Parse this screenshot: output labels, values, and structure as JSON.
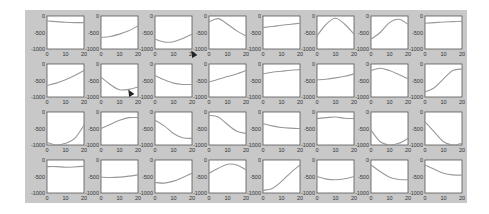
{
  "figure": {
    "background": "#c8c8c8",
    "axes_background": "#ffffff",
    "line_color": "#999999",
    "frame_color": "#555555"
  },
  "chart_data": {
    "type": "line",
    "layout": {
      "rows": 4,
      "cols": 8,
      "grid": false,
      "legend": "none"
    },
    "shared_axes": {
      "xlim": [
        0,
        20
      ],
      "ylim": [
        -1000,
        0
      ],
      "xticks": [
        0,
        10,
        20
      ],
      "xtick_labels": [
        "0",
        "10",
        "20"
      ],
      "yticks": [
        0,
        -500,
        -1000
      ],
      "ytick_labels": [
        "0",
        "-500",
        "-1000"
      ]
    },
    "x": [
      0,
      5,
      10,
      15,
      20
    ],
    "panels": [
      {
        "row": 1,
        "col": 1,
        "y": [
          -150,
          -170,
          -190,
          -200,
          -200
        ]
      },
      {
        "row": 1,
        "col": 2,
        "y": [
          -650,
          -620,
          -550,
          -450,
          -300
        ]
      },
      {
        "row": 1,
        "col": 3,
        "y": [
          -700,
          -790,
          -780,
          -680,
          -550
        ]
      },
      {
        "row": 1,
        "col": 4,
        "y": [
          -180,
          -80,
          -250,
          -450,
          -600
        ]
      },
      {
        "row": 1,
        "col": 5,
        "y": [
          -350,
          -320,
          -280,
          -250,
          -220
        ]
      },
      {
        "row": 1,
        "col": 6,
        "y": [
          -600,
          -250,
          -70,
          -250,
          -550
        ]
      },
      {
        "row": 1,
        "col": 7,
        "y": [
          -700,
          -500,
          -200,
          -100,
          -250
        ]
      },
      {
        "row": 1,
        "col": 8,
        "y": [
          -220,
          -200,
          -180,
          -170,
          -160
        ]
      },
      {
        "row": 2,
        "col": 1,
        "y": [
          -650,
          -580,
          -480,
          -350,
          -200
        ]
      },
      {
        "row": 2,
        "col": 2,
        "y": [
          -400,
          -620,
          -780,
          -770,
          -700
        ]
      },
      {
        "row": 2,
        "col": 3,
        "y": [
          -350,
          -480,
          -580,
          -620,
          -620
        ]
      },
      {
        "row": 2,
        "col": 4,
        "y": [
          -550,
          -460,
          -380,
          -300,
          -200
        ]
      },
      {
        "row": 2,
        "col": 5,
        "y": [
          -300,
          -250,
          -220,
          -190,
          -170
        ]
      },
      {
        "row": 2,
        "col": 6,
        "y": [
          -480,
          -460,
          -420,
          -370,
          -300
        ]
      },
      {
        "row": 2,
        "col": 7,
        "y": [
          -200,
          -130,
          -200,
          -320,
          -450
        ]
      },
      {
        "row": 2,
        "col": 8,
        "y": [
          -850,
          -720,
          -450,
          -200,
          -150
        ]
      },
      {
        "row": 3,
        "col": 1,
        "y": [
          -920,
          -1000,
          -950,
          -800,
          -400
        ]
      },
      {
        "row": 3,
        "col": 2,
        "y": [
          -500,
          -380,
          -250,
          -170,
          -170
        ]
      },
      {
        "row": 3,
        "col": 3,
        "y": [
          -250,
          -420,
          -650,
          -780,
          -800
        ]
      },
      {
        "row": 3,
        "col": 4,
        "y": [
          -100,
          -150,
          -380,
          -580,
          -650
        ]
      },
      {
        "row": 3,
        "col": 5,
        "y": [
          -350,
          -420,
          -470,
          -490,
          -500
        ]
      },
      {
        "row": 3,
        "col": 6,
        "y": [
          -200,
          -170,
          -150,
          -190,
          -200
        ]
      },
      {
        "row": 3,
        "col": 7,
        "y": [
          -550,
          -900,
          -1000,
          -950,
          -800
        ]
      },
      {
        "row": 3,
        "col": 8,
        "y": [
          -300,
          -600,
          -900,
          -1000,
          -950
        ]
      },
      {
        "row": 4,
        "col": 1,
        "y": [
          -200,
          -200,
          -220,
          -210,
          -190
        ]
      },
      {
        "row": 4,
        "col": 2,
        "y": [
          -520,
          -530,
          -520,
          -490,
          -450
        ]
      },
      {
        "row": 4,
        "col": 3,
        "y": [
          -680,
          -700,
          -640,
          -530,
          -400
        ]
      },
      {
        "row": 4,
        "col": 4,
        "y": [
          -400,
          -250,
          -130,
          -150,
          -300
        ]
      },
      {
        "row": 4,
        "col": 5,
        "y": [
          -920,
          -860,
          -650,
          -380,
          -150
        ]
      },
      {
        "row": 4,
        "col": 6,
        "y": [
          -500,
          -580,
          -600,
          -570,
          -500
        ]
      },
      {
        "row": 4,
        "col": 7,
        "y": [
          -150,
          -350,
          -520,
          -590,
          -600
        ]
      },
      {
        "row": 4,
        "col": 8,
        "y": [
          -150,
          -280,
          -400,
          -450,
          -460
        ]
      }
    ]
  },
  "cursors": [
    {
      "x": 190,
      "y": 50
    },
    {
      "x": 127,
      "y": 89
    }
  ]
}
